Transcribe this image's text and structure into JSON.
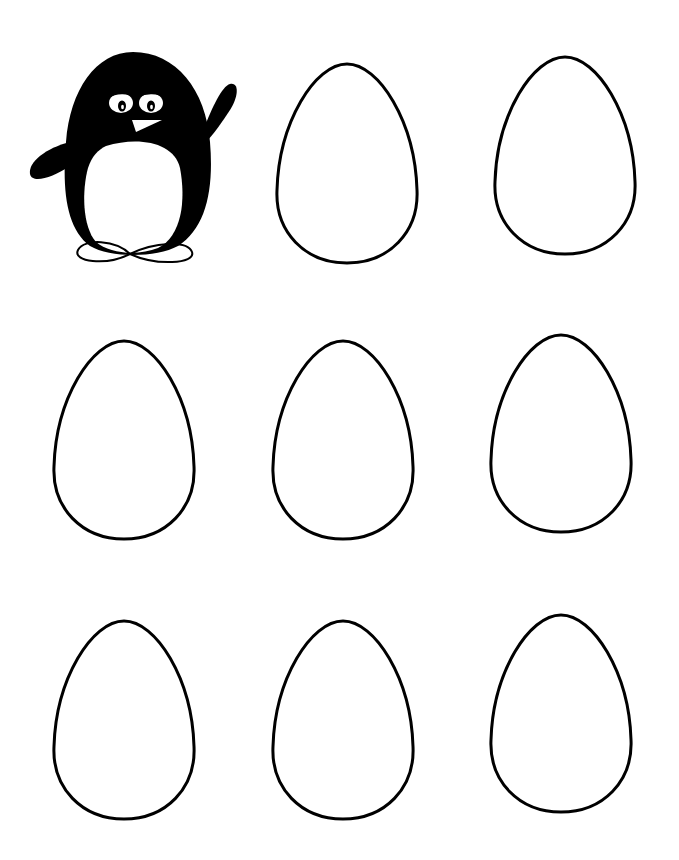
{
  "worksheet": {
    "background_color": "#ffffff",
    "ink_color": "#000000",
    "penguin": {
      "icon": "penguin-waving-illustration",
      "position": {
        "x": 26,
        "y": 50,
        "width": 214,
        "height": 222
      }
    },
    "eggs": [
      {
        "id": 1,
        "row": 1,
        "col": 2,
        "x": 275,
        "y": 62,
        "width": 144,
        "height": 203
      },
      {
        "id": 2,
        "row": 1,
        "col": 3,
        "x": 493,
        "y": 55,
        "width": 144,
        "height": 201
      },
      {
        "id": 3,
        "row": 2,
        "col": 1,
        "x": 52,
        "y": 339,
        "width": 144,
        "height": 202
      },
      {
        "id": 4,
        "row": 2,
        "col": 2,
        "x": 271,
        "y": 339,
        "width": 144,
        "height": 202
      },
      {
        "id": 5,
        "row": 2,
        "col": 3,
        "x": 489,
        "y": 333,
        "width": 144,
        "height": 201
      },
      {
        "id": 6,
        "row": 3,
        "col": 1,
        "x": 52,
        "y": 619,
        "width": 144,
        "height": 202
      },
      {
        "id": 7,
        "row": 3,
        "col": 2,
        "x": 271,
        "y": 619,
        "width": 144,
        "height": 202
      },
      {
        "id": 8,
        "row": 3,
        "col": 3,
        "x": 489,
        "y": 613,
        "width": 144,
        "height": 201
      }
    ]
  }
}
